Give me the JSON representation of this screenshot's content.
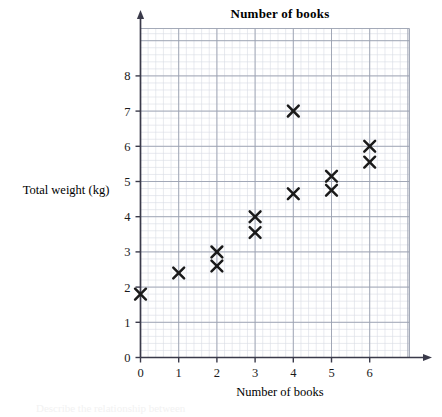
{
  "chart_data": {
    "type": "scatter",
    "title": "Number of books",
    "xlabel": "Number of books",
    "ylabel": "Total weight (kg)",
    "xlim": [
      0,
      7
    ],
    "ylim": [
      0,
      8.7
    ],
    "grid": true,
    "grid_minor_per_major": 5,
    "legend": null,
    "marker": "x",
    "xticks": [
      0,
      1,
      2,
      3,
      4,
      5,
      6
    ],
    "xtick_labels": [
      "0",
      "1",
      "2",
      "3",
      "4",
      "5",
      "6"
    ],
    "yticks": [
      0,
      1,
      2,
      3,
      4,
      5,
      6,
      7,
      8
    ],
    "ytick_labels": [
      "0",
      "1",
      "2",
      "3",
      "4",
      "5",
      "6",
      "7",
      "8"
    ],
    "points": [
      {
        "x": 0,
        "y": 1.8
      },
      {
        "x": 1,
        "y": 2.4
      },
      {
        "x": 2,
        "y": 3.0
      },
      {
        "x": 2,
        "y": 2.6
      },
      {
        "x": 3,
        "y": 4.0
      },
      {
        "x": 3,
        "y": 3.55
      },
      {
        "x": 4,
        "y": 7.0
      },
      {
        "x": 4,
        "y": 4.65
      },
      {
        "x": 5,
        "y": 5.15
      },
      {
        "x": 5,
        "y": 4.75
      },
      {
        "x": 6,
        "y": 6.0
      },
      {
        "x": 6,
        "y": 5.55
      }
    ]
  },
  "footer": {
    "note": "Describe the relationship between"
  },
  "colors": {
    "marker": "#1a1a1a",
    "axis": "#3a3a4a",
    "grid_major": "#9aa0b0",
    "grid_minor": "#d8dbe4",
    "background": "#ffffff"
  }
}
